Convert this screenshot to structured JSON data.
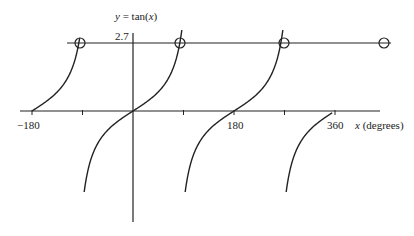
{
  "chart_data": {
    "type": "line",
    "title": "y = tan(x)",
    "title_parts": {
      "var": "y",
      "eq": " = tan(",
      "arg": "x",
      "close": ")"
    },
    "xlabel": "x (degrees)",
    "xlabel_parts": {
      "var": "x",
      "rest": " (degrees)"
    },
    "ylabel": "y",
    "x_tick_labels": [
      "-180",
      "180",
      "360"
    ],
    "x_tick_label_text": [
      "−180",
      "180",
      "360"
    ],
    "x_ticks": [
      -180,
      -90,
      0,
      90,
      180,
      270,
      360
    ],
    "xlim": [
      -205,
      440
    ],
    "ylim": [
      -3.5,
      3.5
    ],
    "grid": false,
    "series": [
      {
        "name": "tan(x)",
        "branches": [
          {
            "from_deg": -180,
            "to_deg": -95
          },
          {
            "from_deg": -87,
            "to_deg": 87
          },
          {
            "from_deg": 93,
            "to_deg": 267
          },
          {
            "from_deg": 273,
            "to_deg": 355
          }
        ]
      }
    ],
    "horizontal_line": {
      "y": 2.7,
      "label": "2.7"
    },
    "intersections": [
      {
        "x": -110,
        "y": 2.7
      },
      {
        "x": 70,
        "y": 2.7
      },
      {
        "x": 250,
        "y": 2.7
      },
      {
        "x": 430,
        "y": 2.7
      }
    ]
  }
}
